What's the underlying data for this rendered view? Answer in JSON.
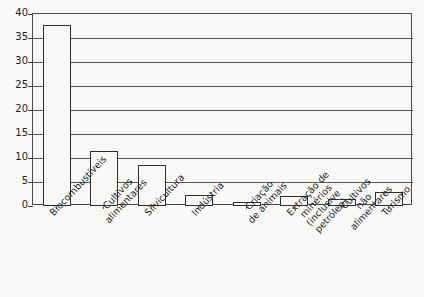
{
  "chart_data": {
    "type": "bar",
    "title": "",
    "xlabel": "",
    "ylabel": "",
    "ylim": [
      0,
      40
    ],
    "ytick_labels": [
      "40",
      "35",
      "30",
      "25",
      "20",
      "15",
      "10",
      "5",
      "0"
    ],
    "ytick_values": [
      40,
      35,
      30,
      25,
      20,
      15,
      10,
      5,
      0
    ],
    "grid": true,
    "legend": "none",
    "categories": [
      "Biocombustíveis",
      "Cultivos alimentares",
      "Silvicultura",
      "Indústria",
      "Criação de animais",
      "Extração de minérios (inclusive petróleo)",
      "Cultivos não alimentares",
      "Turismo"
    ],
    "category_lines": [
      [
        "Biocombustíveis"
      ],
      [
        "Cultivos",
        "alimentares"
      ],
      [
        "Silvicultura"
      ],
      [
        "Indústria"
      ],
      [
        "Criação",
        "de animais"
      ],
      [
        "Extração de",
        "minérios",
        "(inclusive",
        "petróleo)"
      ],
      [
        "Cultivos",
        "não",
        "alimentares"
      ],
      [
        "Turismo"
      ]
    ],
    "values": [
      37.7,
      11.5,
      8.5,
      2.3,
      0.8,
      2.1,
      1.4,
      3.0
    ]
  },
  "colors": {
    "background": "#f8f8f6",
    "bar_fill": "#f8f8f6",
    "bar_stroke": "#2e2e2e",
    "gridline": "#565656",
    "axis": "#4a4a4a",
    "text": "#1d1d1d"
  }
}
